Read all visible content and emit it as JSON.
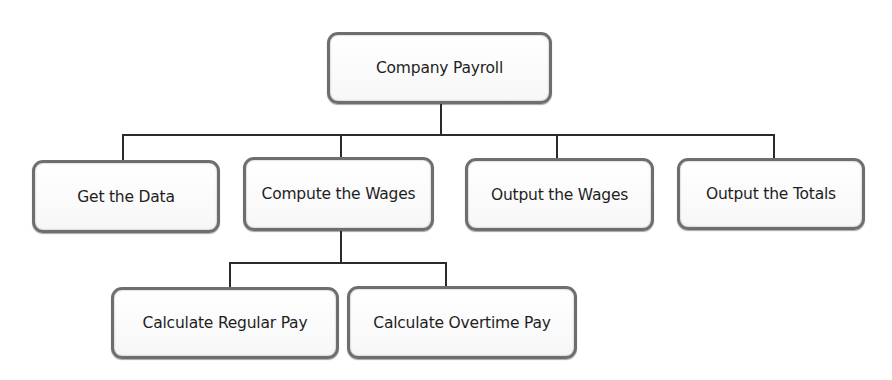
{
  "diagram": {
    "type": "hierarchy-chart",
    "root": {
      "label": "Company Payroll"
    },
    "level1": [
      {
        "label": "Get the Data"
      },
      {
        "label": "Compute the Wages"
      },
      {
        "label": "Output the Wages"
      },
      {
        "label": "Output the Totals"
      }
    ],
    "level2": {
      "parent": "Compute the Wages",
      "children": [
        {
          "label": "Calculate Regular Pay"
        },
        {
          "label": "Calculate Overtime Pay"
        }
      ]
    },
    "colors": {
      "box_border": "#6e6e6e",
      "box_fill": "#ffffff",
      "connector": "#2a2a2a",
      "text": "#1e1e1e"
    }
  }
}
